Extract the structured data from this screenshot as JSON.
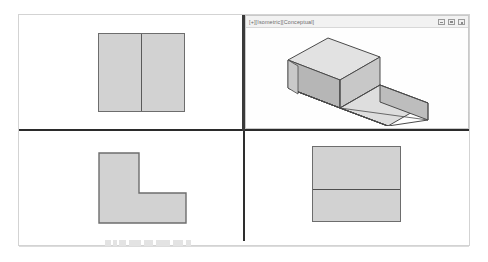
{
  "app": {
    "background_color": "#ffffff",
    "frame_border_color": "#d3d3d3",
    "divider_color": "#2b2b2b"
  },
  "viewports": {
    "top_left": {
      "name": "front-view",
      "shape": "rectangle-with-vertical-split",
      "fill_color": "#d2d2d2",
      "edge_color": "#6d6d6d"
    },
    "top_right": {
      "name": "isometric-conceptual-view",
      "title": "[+][Isometric][Conceptual]",
      "window_buttons": [
        "minimize",
        "maximize",
        "close"
      ],
      "shape": "stepped-block-isometric",
      "face_colors": {
        "top": "#e0e0e0",
        "front": "#c6c6c6",
        "side": "#b4b4b4",
        "inner": "#cfcfcf"
      },
      "edge_color": "#4a4a4a"
    },
    "bottom_left": {
      "name": "side-view",
      "shape": "l-profile",
      "fill_color": "#d2d2d2",
      "edge_color": "#6d6d6d"
    },
    "bottom_right": {
      "name": "top-view",
      "shape": "rectangle-with-horizontal-split",
      "fill_color": "#d2d2d2",
      "edge_color": "#6d6d6d"
    }
  },
  "status_bar": {
    "marks": [
      {
        "left": 86,
        "width": 6
      },
      {
        "left": 94,
        "width": 4
      },
      {
        "left": 100,
        "width": 7
      },
      {
        "left": 110,
        "width": 12
      },
      {
        "left": 125,
        "width": 9
      },
      {
        "left": 137,
        "width": 14
      },
      {
        "left": 154,
        "width": 10
      },
      {
        "left": 167,
        "width": 5
      }
    ]
  }
}
